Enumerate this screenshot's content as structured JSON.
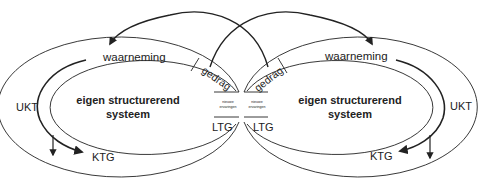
{
  "diagram": {
    "left_system": {
      "perception_label": "waarneming",
      "behavior_label": "gedrag",
      "new_experiences_label_line1": "nieuwe",
      "new_experiences_label_line2": "ervaringen",
      "ltm_label": "LTG",
      "stm_label": "KTG",
      "ukt_label": "UKT",
      "core_label_line1": "eigen structurerend",
      "core_label_line2": "systeem"
    },
    "right_system": {
      "perception_label": "waarneming",
      "behavior_label": "gedrag",
      "new_experiences_label_line1": "nieuwe",
      "new_experiences_label_line2": "ervaringen",
      "ltm_label": "LTG",
      "stm_label": "KTG",
      "ukt_label": "UKT",
      "core_label_line1": "eigen structurerend",
      "core_label_line2": "systeem"
    },
    "colors": {
      "stroke": "#222222",
      "background": "#ffffff"
    }
  }
}
